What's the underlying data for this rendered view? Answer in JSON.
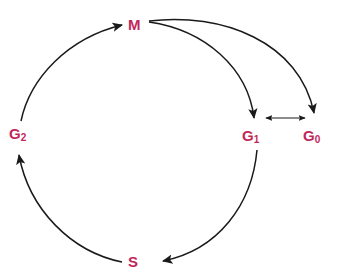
{
  "diagram": {
    "type": "cycle-diagram",
    "background_color": "#ffffff",
    "label_color": "#c2275a",
    "arrow_color": "#1a1a1a",
    "nodes": [
      {
        "id": "M",
        "label": "M",
        "subscript": "",
        "x": 135,
        "y": 24,
        "description": "Mitosis phase"
      },
      {
        "id": "G1",
        "label": "G",
        "subscript": "1",
        "x": 252,
        "y": 135,
        "description": "Gap 1 phase"
      },
      {
        "id": "G0",
        "label": "G",
        "subscript": "0",
        "x": 313,
        "y": 135,
        "description": "Gap 0 quiescent phase"
      },
      {
        "id": "G2",
        "label": "G",
        "subscript": "2",
        "x": 19,
        "y": 133,
        "description": "Gap 2 phase"
      },
      {
        "id": "S",
        "label": "S",
        "subscript": "",
        "x": 134,
        "y": 261,
        "description": "Synthesis phase"
      }
    ],
    "edges": [
      {
        "id": "m-to-g1",
        "from": "M",
        "to": "G1",
        "style": "curved",
        "direction": "one-way"
      },
      {
        "id": "m-to-g0",
        "from": "M",
        "to": "G0",
        "style": "curved",
        "direction": "one-way"
      },
      {
        "id": "g1-to-g0",
        "from": "G1",
        "to": "G0",
        "style": "straight",
        "direction": "two-way"
      },
      {
        "id": "g1-to-s",
        "from": "G1",
        "to": "S",
        "style": "curved",
        "direction": "one-way"
      },
      {
        "id": "s-to-g2",
        "from": "S",
        "to": "G2",
        "style": "curved",
        "direction": "one-way"
      },
      {
        "id": "g2-to-m",
        "from": "G2",
        "to": "M",
        "style": "curved",
        "direction": "one-way"
      }
    ]
  }
}
